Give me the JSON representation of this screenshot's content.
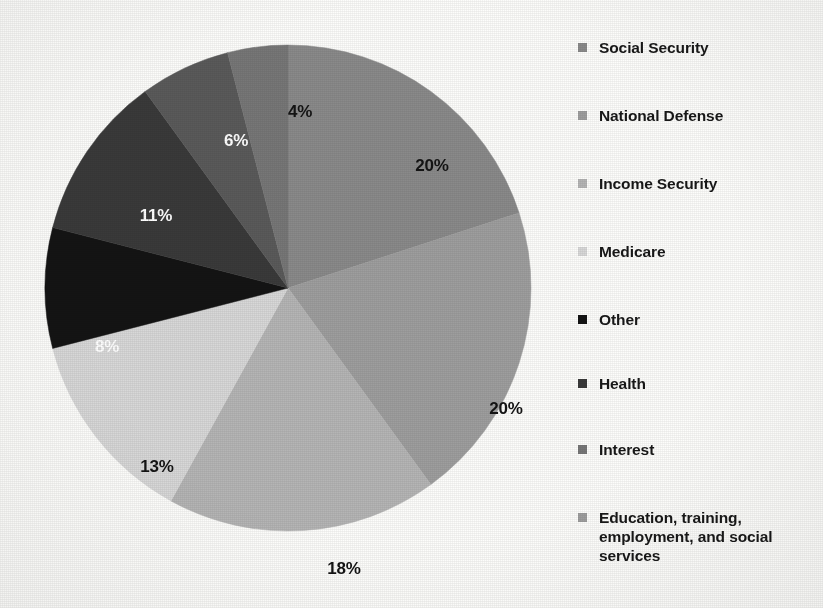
{
  "chart_data": {
    "type": "pie",
    "title": "",
    "subtitle": "",
    "xlabel": "",
    "ylabel": "",
    "legend_position": "right",
    "grid": false,
    "start_angle_deg": 0,
    "direction": "clockwise",
    "units": "percent",
    "categories": [
      "Social Security",
      "National Defense",
      "Income Security",
      "Medicare",
      "Other",
      "Health",
      "Interest",
      "Education, training, employment, and social services"
    ],
    "values": [
      20,
      20,
      18,
      13,
      8,
      11,
      6,
      4
    ],
    "data_labels": [
      "20%",
      "20%",
      "18%",
      "13%",
      "8%",
      "11%",
      "6%",
      "4%"
    ],
    "colors": [
      "#8a8a8a",
      "#9e9e9e",
      "#b5b5b5",
      "#d8d8d8",
      "#141414",
      "#3a3a3a",
      "#5a5a5a",
      "#777777"
    ],
    "slices": [
      {
        "name": "Social Security",
        "value": 20,
        "label": "20%",
        "color": "#8a8a8a",
        "label_color": "dark",
        "label_x": 388,
        "label_y": 122
      },
      {
        "name": "National Defense",
        "value": 20,
        "label": "20%",
        "color": "#9e9e9e",
        "label_color": "dark",
        "label_x": 462,
        "label_y": 365
      },
      {
        "name": "Income Security",
        "value": 18,
        "label": "18%",
        "color": "#b5b5b5",
        "label_color": "dark",
        "label_x": 300,
        "label_y": 525
      },
      {
        "name": "Medicare",
        "value": 13,
        "label": "13%",
        "color": "#d8d8d8",
        "label_color": "dark",
        "label_x": 113,
        "label_y": 423
      },
      {
        "name": "Other",
        "value": 8,
        "label": "8%",
        "color": "#141414",
        "label_color": "light",
        "label_x": 63,
        "label_y": 303
      },
      {
        "name": "Health",
        "value": 11,
        "label": "11%",
        "color": "#3a3a3a",
        "label_color": "light",
        "label_x": 112,
        "label_y": 172
      },
      {
        "name": "Interest",
        "value": 6,
        "label": "6%",
        "color": "#5a5a5a",
        "label_color": "light",
        "label_x": 192,
        "label_y": 97
      },
      {
        "name": "Education, training, employment, and social services",
        "value": 4,
        "label": "4%",
        "color": "#777777",
        "label_color": "dark",
        "label_x": 256,
        "label_y": 68
      }
    ]
  },
  "legend": {
    "items": [
      {
        "label": "Social Security",
        "color": "#8a8a8a",
        "swatch": "legend-swatch-icon"
      },
      {
        "label": "National Defense",
        "color": "#9e9e9e",
        "swatch": "legend-swatch-icon"
      },
      {
        "label": "Income Security",
        "color": "#b5b5b5",
        "swatch": "legend-swatch-icon"
      },
      {
        "label": "Medicare",
        "color": "#d8d8d8",
        "swatch": "legend-swatch-icon"
      },
      {
        "label": "Other",
        "color": "#141414",
        "swatch": "legend-swatch-icon"
      },
      {
        "label": "Health",
        "color": "#3a3a3a",
        "swatch": "legend-swatch-icon"
      },
      {
        "label": "Interest",
        "color": "#777777",
        "swatch": "legend-swatch-icon"
      },
      {
        "label": "Education, training, employment, and social services",
        "color": "#9e9e9e",
        "swatch": "legend-swatch-icon"
      }
    ],
    "row_tops": [
      38,
      106,
      174,
      242,
      310,
      374,
      440,
      508
    ]
  },
  "geometry": {
    "center_x": 244,
    "center_y": 244,
    "radius": 243
  }
}
